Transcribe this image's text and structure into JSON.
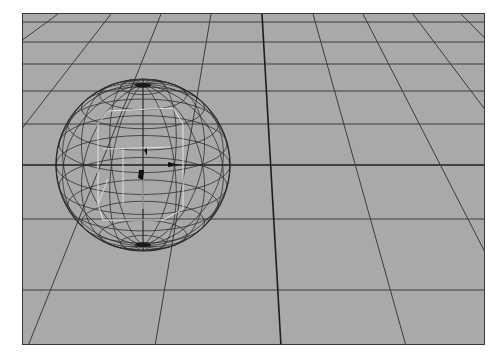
{
  "viewport": {
    "name": "3D perspective viewport",
    "background": "#a9a9a9",
    "grid_color": "#3c3c3c",
    "axis_color": "#1e1e1e",
    "frame": {
      "x": 22,
      "y": 13,
      "width": 463,
      "height": 332
    }
  },
  "grid": {
    "horizontal_lines_y": [
      8,
      28,
      50,
      77,
      110,
      151,
      205,
      276
    ],
    "axis_line_y": 151,
    "converging_lines": [
      {
        "top_x": 35,
        "bottom_x": -420
      },
      {
        "top_x": 88,
        "bottom_x": -170
      },
      {
        "top_x": 138,
        "bottom_x": 5
      },
      {
        "top_x": 188,
        "bottom_x": 132
      },
      {
        "top_x": 239,
        "bottom_x": 258,
        "axis": true
      },
      {
        "top_x": 290,
        "bottom_x": 383
      },
      {
        "top_x": 340,
        "bottom_x": 510
      },
      {
        "top_x": 390,
        "bottom_x": 640
      },
      {
        "top_x": 438,
        "bottom_x": 765
      }
    ]
  },
  "object": {
    "type": "wireframe-sphere",
    "selected": true,
    "center": {
      "x": 120,
      "y": 151
    },
    "radius_x": 87,
    "radius_y": 86,
    "wire_color": "#2a2a2a",
    "manipulator_color": "#e8e8e8",
    "latitude_rings": 12,
    "longitude_segments": 16
  }
}
